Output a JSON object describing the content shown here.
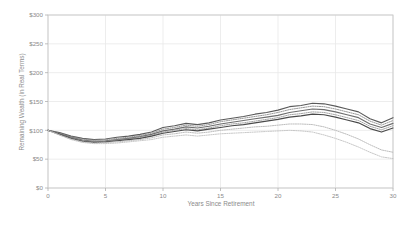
{
  "chart_data": {
    "type": "line",
    "title": "",
    "xlabel": "Years Since Retirement",
    "ylabel": "Remaining Wealth (in Real Terms)",
    "xlim": [
      0,
      30
    ],
    "ylim": [
      0,
      300
    ],
    "xticks": [
      0,
      5,
      10,
      15,
      20,
      25,
      30
    ],
    "xtick_labels": [
      "0",
      "5",
      "10",
      "15",
      "20",
      "25",
      "30"
    ],
    "yticks": [
      0,
      50,
      100,
      150,
      200,
      250,
      300
    ],
    "ytick_labels": [
      "$0",
      "$50",
      "$100",
      "$150",
      "$200",
      "$250",
      "$300"
    ],
    "grid": true,
    "legend": "none",
    "x": [
      0,
      1,
      2,
      3,
      4,
      5,
      6,
      7,
      8,
      9,
      10,
      11,
      12,
      13,
      14,
      15,
      16,
      17,
      18,
      19,
      20,
      21,
      22,
      23,
      24,
      25,
      26,
      27,
      28,
      29,
      30
    ],
    "series": [
      {
        "name": "Strategy 1 (upper solid)",
        "color": "#5a5a5a",
        "style": "solid",
        "values": [
          100,
          96,
          90,
          86,
          84,
          85,
          88,
          90,
          93,
          97,
          105,
          108,
          112,
          110,
          113,
          118,
          121,
          124,
          128,
          131,
          135,
          141,
          143,
          147,
          146,
          142,
          137,
          132,
          120,
          113,
          122
        ]
      },
      {
        "name": "Strategy 2 (upper dotted)",
        "color": "#8c8c8c",
        "style": "dotted",
        "values": [
          100,
          95,
          89,
          85,
          83,
          84,
          86,
          88,
          91,
          95,
          102,
          105,
          109,
          107,
          110,
          115,
          118,
          121,
          124,
          127,
          131,
          136,
          139,
          142,
          141,
          137,
          132,
          127,
          116,
          109,
          117
        ]
      },
      {
        "name": "Strategy 3 (middle solid)",
        "color": "#6e6e6e",
        "style": "solid",
        "values": [
          100,
          94,
          88,
          83,
          81,
          82,
          84,
          86,
          89,
          93,
          99,
          102,
          106,
          104,
          107,
          111,
          114,
          117,
          120,
          123,
          126,
          131,
          134,
          137,
          136,
          132,
          127,
          122,
          111,
          105,
          112
        ]
      },
      {
        "name": "Strategy 4 (lower dotted)",
        "color": "#9a9a9a",
        "style": "dotted",
        "values": [
          100,
          93,
          87,
          82,
          80,
          81,
          83,
          85,
          88,
          91,
          97,
          100,
          103,
          101,
          104,
          108,
          111,
          113,
          116,
          119,
          122,
          127,
          129,
          132,
          131,
          127,
          122,
          117,
          107,
          101,
          108
        ]
      },
      {
        "name": "Strategy 5 (lower solid)",
        "color": "#4a4a4a",
        "style": "solid",
        "values": [
          100,
          93,
          86,
          81,
          79,
          80,
          82,
          84,
          86,
          90,
          95,
          98,
          101,
          99,
          102,
          105,
          108,
          110,
          113,
          116,
          119,
          123,
          125,
          128,
          127,
          123,
          118,
          113,
          103,
          97,
          104
        ]
      },
      {
        "name": "Strategy 6 (declining dotted)",
        "color": "#b5b5b5",
        "style": "dotted",
        "values": [
          100,
          92,
          85,
          80,
          78,
          79,
          80,
          82,
          84,
          87,
          92,
          94,
          97,
          95,
          97,
          100,
          102,
          104,
          106,
          107,
          109,
          111,
          111,
          110,
          106,
          100,
          93,
          85,
          75,
          66,
          62
        ]
      },
      {
        "name": "Strategy 7 (lowest dotted)",
        "color": "#c2c2c2",
        "style": "dotted",
        "values": [
          100,
          92,
          84,
          79,
          77,
          77,
          78,
          80,
          82,
          84,
          88,
          90,
          92,
          90,
          92,
          94,
          95,
          96,
          97,
          98,
          99,
          100,
          99,
          97,
          92,
          86,
          79,
          71,
          62,
          54,
          51
        ]
      }
    ]
  },
  "axes": {
    "x_title": "Years Since Retirement",
    "y_title": "Remaining Wealth (in Real Terms)"
  }
}
